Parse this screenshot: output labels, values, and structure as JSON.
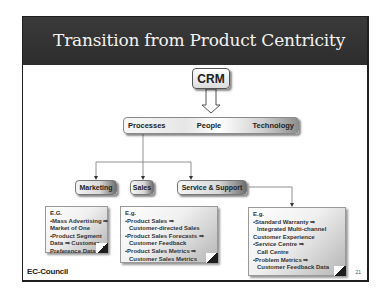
{
  "slide": {
    "title": "Transition from Product Centricity",
    "root": {
      "label": "CRM"
    },
    "pillars": [
      "Processes",
      "People",
      "Technology"
    ],
    "departments": [
      {
        "label": "Marketing"
      },
      {
        "label": "Sales"
      },
      {
        "label": "Service & Support"
      }
    ],
    "notes": {
      "marketing": {
        "heading": "E.G.",
        "lines": [
          "•Mass Advertising ⇒",
          "Market of One",
          "•Product Segment",
          "Data ⇒ Customer",
          "Preference Data"
        ]
      },
      "sales": {
        "heading": "E.g.",
        "lines": [
          "•Product Sales ⇒",
          "Customer-directed Sales",
          "•Product Sales Forecasts ⇒",
          "Customer Feedback",
          "•Product Sales Metrics ⇒",
          "Customer Sales Metrics"
        ]
      },
      "service": {
        "heading": "E.g.",
        "lines": [
          "•Standard Warranty ⇒",
          "Integrated Multi-channel",
          "Customer Experience",
          "•Service Centre ⇒",
          "Call Centre",
          "•Problem Metrics ⇒",
          "Customer Feedback Data"
        ]
      }
    },
    "footer": {
      "logo": "EC-Council",
      "page_number": "21"
    },
    "colors": {
      "title_bar": "#2d2d2d",
      "title_text": "#f2f2f2",
      "connector": "#666666"
    }
  }
}
